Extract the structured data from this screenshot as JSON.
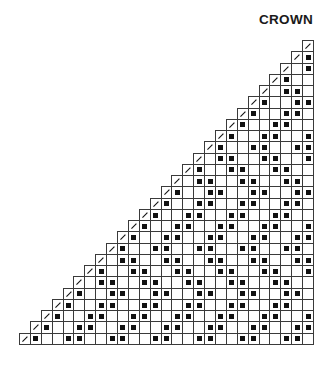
{
  "title": "CROWN",
  "legend_symbols": {
    "/": "slash-stitch (k2tog)",
    "#": "filled-square stitch",
    ".": "empty stitch"
  },
  "grid": {
    "rows": 27,
    "cols": 27,
    "row_strings_top_to_bottom": [
      "                          /",
      "                         /#",
      "                        /.#",
      "                       /#..",
      "                      /.##.",
      "                     /#..##",
      "                    /#..##.",
      "                   /#..##..",
      "                  /#..##..#",
      "                 /#..##..##",
      "                /.##..##..#",
      "               /#..##..##..",
      "              /.##..##..##.",
      "             /#..##..##..##",
      "            /#..##..##..##.",
      "           /#..##..##..##..",
      "          /#..##..##..##..#",
      "         /#..##..##..##..##",
      "        /#..##..##..##..##.",
      "       /.##..##..##..##..##",
      "      /#..##..##..##..##..#",
      "     /.##..##..##..##..##..",
      "    /#..##..##..##..##..##.",
      "   /#..##..##..##..##..##..",
      "  /#..##..##..##..##..##..#",
      " /#..##..##..##..##..##..##",
      "/#..##..##..##..##..##..##."
    ]
  }
}
